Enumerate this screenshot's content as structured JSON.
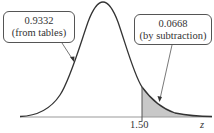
{
  "figure": {
    "callouts": {
      "left": {
        "value": "0.9332",
        "note": "(from tables)"
      },
      "right": {
        "value": "0.0668",
        "note": "(by subtraction)"
      }
    },
    "axis": {
      "tick_label": "1.50",
      "variable": "z"
    },
    "colors": {
      "curve": "#333333",
      "shading": "#c8c8c8",
      "axis": "#999999"
    }
  }
}
